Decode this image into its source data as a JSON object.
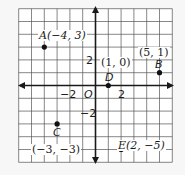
{
  "diagram": {
    "type": "coordinate-plane",
    "grid": {
      "x_min": -6,
      "x_max": 6,
      "y_min": -6,
      "y_max": 6,
      "step": 1
    },
    "axis_tick_labels": {
      "x": [
        {
          "value": -2,
          "text": "−2"
        },
        {
          "value": 2,
          "text": "2"
        }
      ],
      "y": [
        {
          "value": 2,
          "text": "2"
        },
        {
          "value": -2,
          "text": "−2"
        }
      ],
      "origin": "O"
    },
    "points": [
      {
        "name": "A",
        "x": -4,
        "y": 3,
        "label": "A(−4, 3)"
      },
      {
        "name": "B",
        "x": 5,
        "y": 1,
        "label": "B",
        "coord_label": "(5, 1)"
      },
      {
        "name": "C",
        "x": -3,
        "y": -3,
        "label": "C",
        "coord_label": "(−3, −3)"
      },
      {
        "name": "D",
        "x": 1,
        "y": 0,
        "label": "D",
        "coord_label": "(1, 0)"
      },
      {
        "name": "E",
        "x": 2,
        "y": -5,
        "label": "E(2, −5)"
      }
    ],
    "colors": {
      "grid": "#555555",
      "axis": "#1a1a1a",
      "point": "#111111",
      "background": "#f7f7f7"
    }
  }
}
